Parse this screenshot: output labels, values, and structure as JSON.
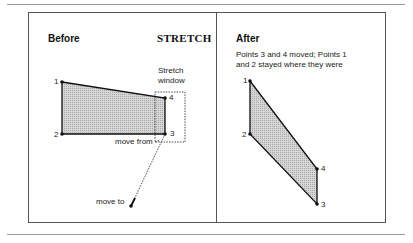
{
  "before": {
    "title": "Before",
    "command": "STRETCH",
    "window_label_line1": "Stretch",
    "window_label_line2": "window",
    "move_from": "move from",
    "move_to": "move to",
    "points": [
      {
        "label": "1"
      },
      {
        "label": "2"
      },
      {
        "label": "3"
      },
      {
        "label": "4"
      }
    ]
  },
  "after": {
    "title": "After",
    "description_line1": "Points 3 and 4 moved; Points 1",
    "description_line2": "and 2 stayed where they were",
    "points": [
      {
        "label": "1"
      },
      {
        "label": "2"
      },
      {
        "label": "3"
      },
      {
        "label": "4"
      }
    ]
  },
  "colors": {
    "fill": "#c8c8c8",
    "stroke": "#111111",
    "border": "#555555"
  }
}
